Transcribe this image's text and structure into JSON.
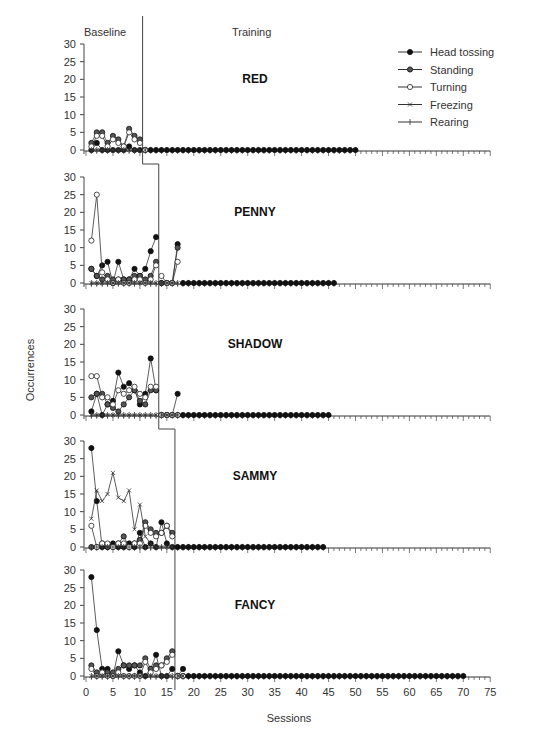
{
  "chart_data": {
    "type": "line",
    "title": "",
    "xlabel": "Sessions",
    "ylabel": "Occurrences",
    "phase_labels": [
      "Baseline",
      "Training"
    ],
    "xlim": [
      0,
      75
    ],
    "ylim": [
      0,
      30
    ],
    "x_ticks": [
      0,
      5,
      10,
      15,
      20,
      25,
      30,
      35,
      40,
      45,
      50,
      55,
      60,
      65,
      70,
      75
    ],
    "y_ticks": [
      0,
      5,
      10,
      15,
      20,
      25,
      30
    ],
    "legend": [
      "Head tossing",
      "Standing",
      "Turning",
      "Freezing",
      "Rearing"
    ],
    "legend_position": "top-right of first panel",
    "panels": [
      {
        "name": "RED",
        "phase_change": 10.5,
        "last_session": 50,
        "series": [
          {
            "name": "Head tossing",
            "values": [
              0,
              2,
              0,
              0,
              0,
              0,
              0,
              1,
              0,
              0,
              0
            ]
          },
          {
            "name": "Standing",
            "values": [
              2,
              5,
              5,
              2,
              4,
              3,
              1,
              6,
              4,
              3,
              0
            ]
          },
          {
            "name": "Turning",
            "values": [
              1,
              4,
              4,
              1,
              3,
              2,
              1,
              5,
              3,
              2,
              0
            ]
          },
          {
            "name": "Freezing",
            "values": [
              0,
              0,
              0,
              0,
              0,
              0,
              0,
              0,
              0,
              0,
              0
            ]
          },
          {
            "name": "Rearing",
            "values": [
              0,
              0,
              0,
              0,
              0,
              0,
              0,
              0,
              0,
              0,
              0
            ]
          }
        ]
      },
      {
        "name": "PENNY",
        "phase_change": 13.5,
        "last_session": 46,
        "series": [
          {
            "name": "Head tossing",
            "values": [
              4,
              2,
              5,
              6,
              0,
              6,
              1,
              1,
              4,
              2,
              4,
              9,
              13,
              0,
              0,
              0,
              11
            ]
          },
          {
            "name": "Standing",
            "values": [
              4,
              2,
              1,
              2,
              1,
              1,
              1,
              1,
              2,
              2,
              1,
              2,
              6,
              0,
              0,
              0,
              10
            ]
          },
          {
            "name": "Turning",
            "values": [
              12,
              25,
              3,
              1,
              0,
              1,
              0,
              0,
              1,
              1,
              0,
              1,
              5,
              2,
              0,
              0,
              6
            ]
          },
          {
            "name": "Freezing",
            "values": [
              0,
              0,
              0,
              0,
              0,
              0,
              0,
              0,
              0,
              0,
              0,
              0,
              0,
              0,
              0,
              0,
              0
            ]
          },
          {
            "name": "Rearing",
            "values": [
              0,
              0,
              0,
              0,
              0,
              0,
              0,
              0,
              0,
              0,
              0,
              0,
              0,
              0,
              0,
              0,
              0
            ]
          }
        ]
      },
      {
        "name": "SHADOW",
        "phase_change": 13.5,
        "last_session": 45,
        "series": [
          {
            "name": "Head tossing",
            "values": [
              1,
              6,
              0,
              3,
              4,
              12,
              8,
              9,
              7,
              3,
              6,
              16,
              7,
              0,
              0,
              0,
              6
            ]
          },
          {
            "name": "Standing",
            "values": [
              5,
              6,
              6,
              3,
              2,
              1,
              3,
              5,
              7,
              4,
              3,
              7,
              7,
              0,
              0,
              0,
              0
            ]
          },
          {
            "name": "Turning",
            "values": [
              11,
              11,
              5,
              5,
              3,
              7,
              6,
              7,
              8,
              6,
              5,
              8,
              8,
              0,
              0,
              0,
              0
            ]
          },
          {
            "name": "Freezing",
            "values": [
              0,
              0,
              0,
              0,
              0,
              0,
              0,
              0,
              0,
              0,
              0,
              0,
              0,
              0,
              0,
              0,
              0
            ]
          },
          {
            "name": "Rearing",
            "values": [
              0,
              0,
              0,
              0,
              0,
              0,
              0,
              0,
              0,
              0,
              0,
              0,
              0,
              0,
              0,
              0,
              0
            ]
          }
        ]
      },
      {
        "name": "SAMMY",
        "phase_change": 16.5,
        "last_session": 44,
        "series": [
          {
            "name": "Head tossing",
            "values": [
              28,
              13,
              0,
              0,
              1,
              0,
              0,
              1,
              0,
              4,
              0,
              1,
              0,
              7,
              1,
              0
            ]
          },
          {
            "name": "Standing",
            "values": [
              0,
              0,
              1,
              0,
              0,
              1,
              3,
              0,
              1,
              2,
              7,
              5,
              4,
              4,
              6,
              4
            ]
          },
          {
            "name": "Turning",
            "values": [
              6,
              0,
              1,
              1,
              0,
              1,
              1,
              0,
              1,
              1,
              6,
              4,
              3,
              4,
              6,
              3
            ]
          },
          {
            "name": "Freezing",
            "values": [
              8,
              16,
              13,
              15,
              21,
              14,
              13,
              16,
              5,
              12,
              3,
              1,
              0,
              0,
              0,
              0
            ]
          },
          {
            "name": "Rearing",
            "values": [
              0,
              0,
              0,
              0,
              0,
              0,
              0,
              0,
              0,
              0,
              0,
              0,
              0,
              0,
              0,
              0
            ]
          }
        ]
      },
      {
        "name": "FANCY",
        "phase_change": 16.5,
        "last_session": 70,
        "series": [
          {
            "name": "Head tossing",
            "values": [
              28,
              13,
              2,
              2,
              0,
              7,
              3,
              2,
              3,
              1,
              0,
              2,
              6,
              0,
              0,
              2,
              0,
              2
            ]
          },
          {
            "name": "Standing",
            "values": [
              3,
              1,
              1,
              1,
              1,
              2,
              3,
              3,
              3,
              3,
              5,
              2,
              3,
              3,
              5,
              7,
              0,
              0
            ]
          },
          {
            "name": "Turning",
            "values": [
              2,
              0,
              1,
              0,
              0,
              1,
              0,
              0,
              0,
              0,
              4,
              1,
              2,
              3,
              4,
              6,
              0,
              0
            ]
          },
          {
            "name": "Freezing",
            "values": [
              0,
              0,
              0,
              0,
              0,
              0,
              0,
              0,
              0,
              0,
              0,
              0,
              0,
              0,
              0,
              0,
              0,
              0
            ]
          },
          {
            "name": "Rearing",
            "values": [
              0,
              0,
              0,
              0,
              0,
              0,
              0,
              0,
              0,
              0,
              0,
              0,
              0,
              0,
              0,
              0,
              0,
              0
            ]
          }
        ]
      }
    ]
  }
}
